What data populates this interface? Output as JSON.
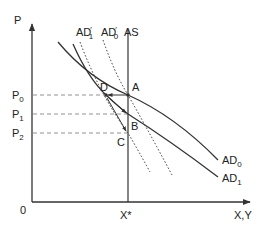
{
  "diagram": {
    "type": "aggregate-demand-supply",
    "axes": {
      "y_label": "P",
      "x_label": "X,Y",
      "origin_label": "0",
      "x_tick_label": "X*"
    },
    "price_levels": [
      {
        "label": "P",
        "sub": "0",
        "y": 95
      },
      {
        "label": "P",
        "sub": "1",
        "y": 114
      },
      {
        "label": "P",
        "sub": "2",
        "y": 133
      }
    ],
    "points": [
      {
        "label": "D",
        "x": 106,
        "y": 95
      },
      {
        "label": "A",
        "x": 128,
        "y": 95
      },
      {
        "label": "B",
        "x": 128,
        "y": 114
      },
      {
        "label": "C",
        "x": 128,
        "y": 133
      }
    ],
    "curves": {
      "AS": {
        "label": "AS",
        "style": "solid",
        "vertical_at": "X*"
      },
      "AD0": {
        "label": "AD",
        "sub": "0",
        "style": "solid"
      },
      "AD1": {
        "label": "AD",
        "sub": "1",
        "style": "solid"
      },
      "AD0_prime": {
        "label": "AD",
        "sub": "0",
        "prime": "′",
        "style": "dotted"
      },
      "AD1_prime": {
        "label": "AD",
        "sub": "1",
        "prime": "′",
        "style": "dotted"
      }
    },
    "colors": {
      "line": "#333333",
      "guide": "#777777"
    }
  }
}
